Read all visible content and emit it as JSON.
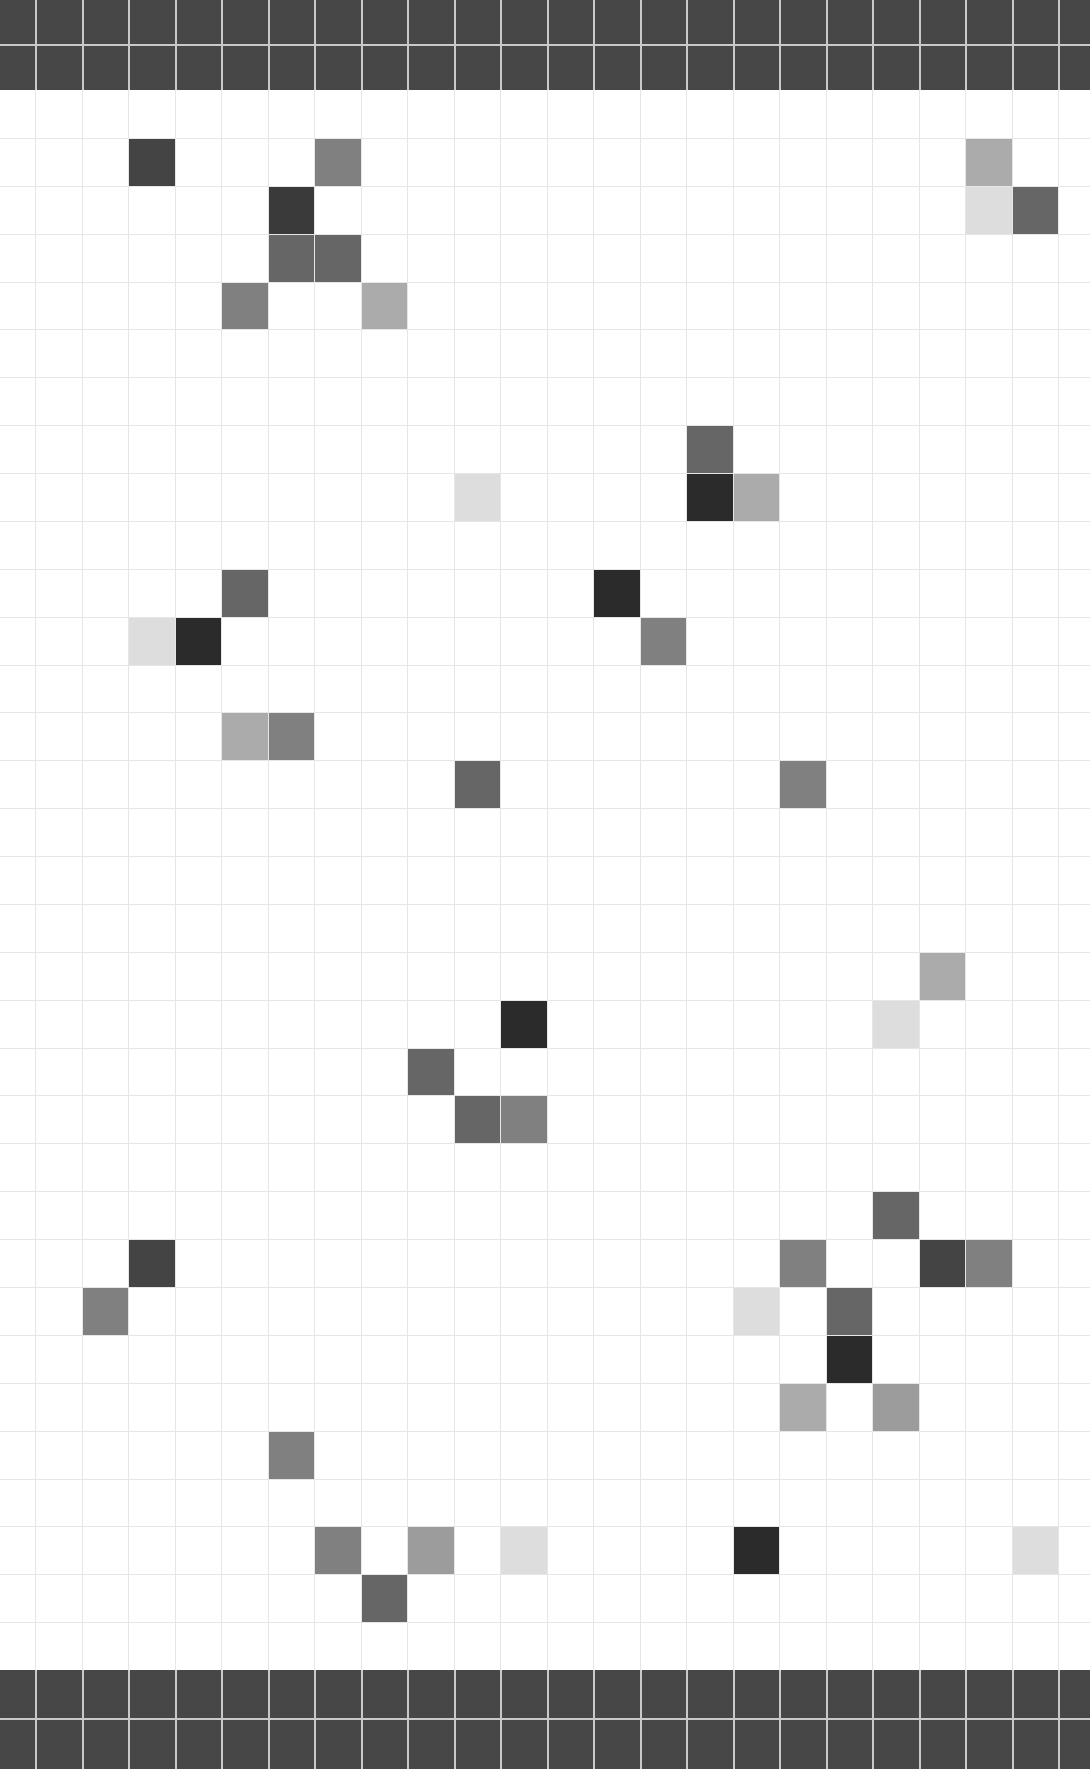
{
  "board": {
    "columns": 24,
    "rows": 33,
    "first_col_width": 35,
    "col_pitch": 46.5,
    "row_pitch": 47.88,
    "top_bar_rows": 2,
    "bottom_bar_rows": 2,
    "colors": {
      "bar": "#474747",
      "grid_line": "#e6e6e6",
      "empty": "#ffffff",
      "level_1": "#2b2b2b",
      "level_2": "#444444",
      "level_3": "#666666",
      "level_4": "#808080",
      "level_5": "#9c9c9c",
      "level_6": "#ababab",
      "level_7": "#dddddd"
    },
    "cells": [
      {
        "col": 3,
        "row": 1,
        "color": "#444444"
      },
      {
        "col": 7,
        "row": 1,
        "color": "#808080"
      },
      {
        "col": 21,
        "row": 1,
        "color": "#ababab"
      },
      {
        "col": 6,
        "row": 2,
        "color": "#3a3a3a"
      },
      {
        "col": 21,
        "row": 2,
        "color": "#dddddd"
      },
      {
        "col": 22,
        "row": 2,
        "color": "#666666"
      },
      {
        "col": 6,
        "row": 3,
        "color": "#666666"
      },
      {
        "col": 7,
        "row": 3,
        "color": "#666666"
      },
      {
        "col": 5,
        "row": 4,
        "color": "#808080"
      },
      {
        "col": 8,
        "row": 4,
        "color": "#ababab"
      },
      {
        "col": 15,
        "row": 7,
        "color": "#666666"
      },
      {
        "col": 10,
        "row": 8,
        "color": "#dddddd"
      },
      {
        "col": 15,
        "row": 8,
        "color": "#2b2b2b"
      },
      {
        "col": 16,
        "row": 8,
        "color": "#ababab"
      },
      {
        "col": 5,
        "row": 10,
        "color": "#666666"
      },
      {
        "col": 13,
        "row": 10,
        "color": "#2b2b2b"
      },
      {
        "col": 3,
        "row": 11,
        "color": "#dddddd"
      },
      {
        "col": 4,
        "row": 11,
        "color": "#2b2b2b"
      },
      {
        "col": 14,
        "row": 11,
        "color": "#808080"
      },
      {
        "col": 5,
        "row": 13,
        "color": "#ababab"
      },
      {
        "col": 6,
        "row": 13,
        "color": "#808080"
      },
      {
        "col": 10,
        "row": 14,
        "color": "#666666"
      },
      {
        "col": 17,
        "row": 14,
        "color": "#808080"
      },
      {
        "col": 20,
        "row": 18,
        "color": "#ababab"
      },
      {
        "col": 11,
        "row": 19,
        "color": "#2b2b2b"
      },
      {
        "col": 19,
        "row": 19,
        "color": "#dddddd"
      },
      {
        "col": 9,
        "row": 20,
        "color": "#666666"
      },
      {
        "col": 10,
        "row": 21,
        "color": "#666666"
      },
      {
        "col": 11,
        "row": 21,
        "color": "#808080"
      },
      {
        "col": 19,
        "row": 23,
        "color": "#666666"
      },
      {
        "col": 3,
        "row": 24,
        "color": "#444444"
      },
      {
        "col": 17,
        "row": 24,
        "color": "#808080"
      },
      {
        "col": 20,
        "row": 24,
        "color": "#444444"
      },
      {
        "col": 21,
        "row": 24,
        "color": "#808080"
      },
      {
        "col": 2,
        "row": 25,
        "color": "#808080"
      },
      {
        "col": 16,
        "row": 25,
        "color": "#dddddd"
      },
      {
        "col": 18,
        "row": 25,
        "color": "#666666"
      },
      {
        "col": 18,
        "row": 26,
        "color": "#2b2b2b"
      },
      {
        "col": 17,
        "row": 27,
        "color": "#ababab"
      },
      {
        "col": 19,
        "row": 27,
        "color": "#9c9c9c"
      },
      {
        "col": 6,
        "row": 28,
        "color": "#808080"
      },
      {
        "col": 7,
        "row": 30,
        "color": "#808080"
      },
      {
        "col": 9,
        "row": 30,
        "color": "#9c9c9c"
      },
      {
        "col": 11,
        "row": 30,
        "color": "#dddddd"
      },
      {
        "col": 16,
        "row": 30,
        "color": "#2b2b2b"
      },
      {
        "col": 22,
        "row": 30,
        "color": "#dddddd"
      },
      {
        "col": 8,
        "row": 31,
        "color": "#666666"
      }
    ]
  }
}
